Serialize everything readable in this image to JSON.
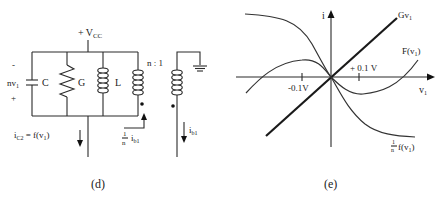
{
  "panel_d": {
    "caption": "(d)",
    "supply_label_plus": "+",
    "supply_label_v": "V",
    "supply_label_sub": "CC",
    "voltage_label_minus": "-",
    "voltage_label": "nv",
    "voltage_label_sub": "1",
    "voltage_label_plus": "+",
    "capacitor_label": "C",
    "resistor_label": "G",
    "inductor_label": "L",
    "turns_ratio": "n : 1",
    "collector_current_label": "i",
    "collector_current_sub": "C2",
    "collector_current_eq": " = f(v",
    "collector_current_eq_sub": "1",
    "collector_current_close": ")",
    "reflected_current_num": "1",
    "reflected_current_den": "n",
    "reflected_current_label": "i",
    "reflected_current_sub": "b1",
    "base_current_label": "i",
    "base_current_sub": "b1"
  },
  "panel_e": {
    "caption": "(e)",
    "y_axis_label": "i",
    "x_axis_label": "v",
    "x_axis_sub": "1",
    "tick_neg_label": "-0.1V",
    "tick_pos_label": "+ 0.1 V",
    "curve_G_label": "Gv",
    "curve_G_sub": "1",
    "curve_F_label": "F(v",
    "curve_F_sub": "1",
    "curve_F_close": ")",
    "curve_f_num": "1",
    "curve_f_den": "n",
    "curve_f_label": " f(v",
    "curve_f_sub": "1",
    "curve_f_close": ")"
  }
}
